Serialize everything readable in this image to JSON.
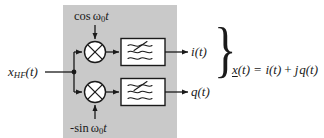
{
  "figure": {
    "kind": "iq-demodulator-block-diagram",
    "panel": {
      "fill": "#c9c9c9",
      "x": 63,
      "y": 5,
      "width": 114,
      "height": 133
    },
    "stroke_color": "#1a1a1a",
    "box_fill": "#ffffff"
  },
  "labels": {
    "lo_top": {
      "fn": "cos",
      "omega": "ω",
      "sub": "0",
      "time": "t"
    },
    "lo_bottom": {
      "fn": "-sin",
      "omega": "ω",
      "sub": "0",
      "time": "t"
    },
    "input": {
      "base": "x",
      "sub": "HF",
      "arg": "(t)"
    },
    "output_i": {
      "base": "i",
      "arg": "(t)"
    },
    "output_q": {
      "base": "q",
      "arg": "(t)"
    },
    "equation": {
      "lhs": "x",
      "lhs_arg": "(t)",
      "eq": "=",
      "term1": "i",
      "term1_arg": "(t)",
      "plus": "+",
      "j": "j",
      "term2": "q",
      "term2_arg": "(t)"
    },
    "brace": "}"
  },
  "components": {
    "mixer_i": {
      "name": "multiplier",
      "glyph": "⊗",
      "cx": 95,
      "cy": 52,
      "r": 11
    },
    "mixer_q": {
      "name": "multiplier",
      "glyph": "⊗",
      "cx": 95,
      "cy": 92,
      "r": 11
    },
    "filter_i": {
      "name": "lowpass-filter",
      "x": 121,
      "y": 38,
      "width": 44,
      "height": 27
    },
    "filter_q": {
      "name": "lowpass-filter",
      "x": 121,
      "y": 78,
      "width": 44,
      "height": 27
    }
  },
  "nodes": {
    "split_node": {
      "x": 74,
      "y": 72
    }
  }
}
